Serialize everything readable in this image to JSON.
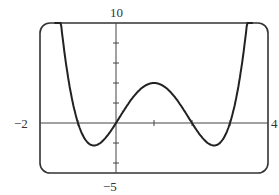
{
  "panel_label": "b)",
  "labels": {
    "ymax": "10",
    "ymin": "−5",
    "xmin": "−2",
    "xmax": "4"
  },
  "chart_data": {
    "type": "line",
    "title": "",
    "xlabel": "",
    "ylabel": "",
    "xlim": [
      -2,
      4
    ],
    "ylim": [
      -5,
      10
    ],
    "grid": false,
    "x_ticks": [
      -1,
      0,
      1,
      2,
      3
    ],
    "y_ticks": [
      -4,
      -2,
      2,
      4,
      6,
      8
    ],
    "series": [
      {
        "name": "f(x) = x(x+1)(x-2)(x-3)",
        "x": [
          -1.6,
          -1.2,
          -1.0,
          -0.8,
          -0.6,
          -0.4,
          -0.2,
          0,
          0.5,
          1.0,
          1.5,
          2.0,
          2.4,
          2.6,
          2.8,
          3.0,
          3.3,
          3.6
        ],
        "y": [
          10,
          2,
          0,
          -1.9,
          -2.7,
          -2.4,
          -1.3,
          0,
          2.8,
          4,
          2.8,
          0,
          -2.2,
          -2.4,
          -1.9,
          0,
          5,
          10
        ]
      }
    ],
    "roots": [
      -1,
      0,
      2,
      3
    ],
    "legend": []
  }
}
